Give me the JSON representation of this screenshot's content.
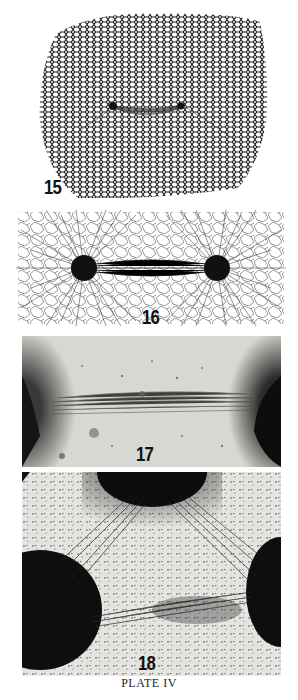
{
  "plate": {
    "caption": "PLATE IV",
    "figures": [
      {
        "number": "15",
        "description": "Deformed hexagonal mesh with two small dark bodies connected at center"
      },
      {
        "number": "16",
        "description": "Two dark spheres with radiating fiber lines and polygonal network"
      },
      {
        "number": "17",
        "description": "Photograph of two dark masses with fibers aligned between them"
      },
      {
        "number": "18",
        "description": "Photograph of three dark masses with particle streams between them"
      }
    ]
  },
  "colors": {
    "ink": "#111111",
    "paper": "#ffffff",
    "photo_bg": "#d8d8d4"
  }
}
